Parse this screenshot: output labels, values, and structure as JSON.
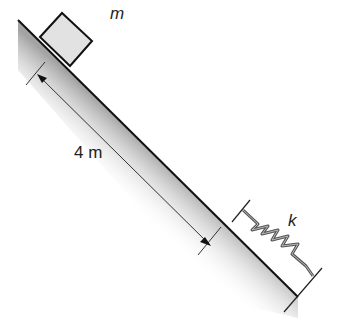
{
  "diagram": {
    "type": "physics-incline-spring",
    "labels": {
      "mass": "m",
      "distance": "4 m",
      "spring_constant": "k"
    },
    "colors": {
      "line": "#111111",
      "block_fill": "#e2e2e2",
      "incline_shade": "#9a9a9a",
      "spring": "#555555"
    }
  }
}
